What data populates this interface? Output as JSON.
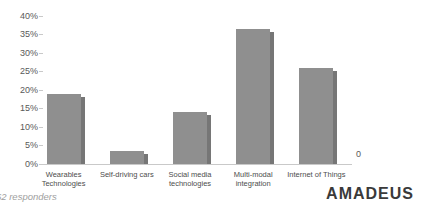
{
  "chart_data": {
    "type": "bar",
    "title": "",
    "categories": [
      "Wearables\nTechnologies",
      "Self-driving cars",
      "Social media\ntechnologies",
      "Multi-modal\nintegration",
      "Internet of Things"
    ],
    "values": [
      19,
      3.5,
      14,
      36.5,
      26
    ],
    "unit": "%",
    "xlabel": "",
    "ylabel": "",
    "ylim": [
      0,
      40
    ],
    "y_tick_step": 5,
    "y_ticks": [
      "40%",
      "35%",
      "30%",
      "25%",
      "20%",
      "15%",
      "10%",
      "5%",
      "0%"
    ],
    "right_axis_label": "0",
    "grid": false,
    "legend": false,
    "bar_color": "#8f8f8f",
    "bar_shadow_color": "#767676"
  },
  "footer": {
    "note": "62 responders"
  },
  "branding": {
    "logo_text": "amadeus",
    "logo_color": "#3a3a3a"
  },
  "colors": {
    "background": "#ffffff",
    "axis_line": "#c9c9c9",
    "tick_text": "#595959",
    "category_text": "#4d4d4d",
    "note_text": "#9e9e9e"
  }
}
